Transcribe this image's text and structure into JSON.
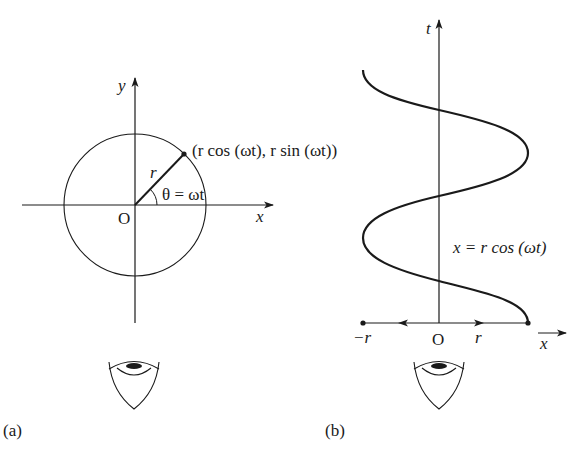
{
  "panel_a": {
    "caption": "(a)",
    "axis_x_label": "x",
    "axis_y_label": "y",
    "origin_label": "O",
    "radius_label": "r",
    "angle_label": "θ = ωt",
    "point_label": "(r cos (ωt), r sin (ωt))",
    "observer": "eye-icon"
  },
  "panel_b": {
    "caption": "(b)",
    "axis_t_label": "t",
    "axis_x_label": "x",
    "origin_label": "O",
    "neg_r_label": "−r",
    "pos_r_label": "r",
    "curve_label": "x = r cos (ωt)",
    "observer": "eye-icon"
  },
  "colors": {
    "ink": "#1a1a1a",
    "background": "#ffffff"
  }
}
